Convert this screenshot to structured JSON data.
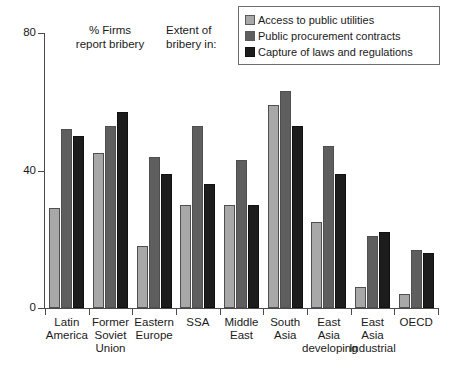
{
  "chart_data": {
    "type": "bar",
    "title": "",
    "xlabel": "",
    "ylabel": "% Firms report bribery",
    "ylim": [
      0,
      80
    ],
    "yticks": [
      0,
      40,
      80
    ],
    "grid": false,
    "legend_position": "top-right",
    "categories": [
      "Latin\nAmerica",
      "Former\nSoviet\nUnion",
      "Eastern\nEurope",
      "SSA",
      "Middle\nEast",
      "South\nAsia",
      "East\nAsia\ndeveloping",
      "East\nAsia\nIndustrial",
      "OECD"
    ],
    "series": [
      {
        "name": "Access to public utilities",
        "color": "#a8a8a8",
        "values": [
          29,
          45,
          18,
          30,
          30,
          59,
          25,
          6,
          4
        ]
      },
      {
        "name": "Public procurement contracts",
        "color": "#5e5e5e",
        "values": [
          52,
          53,
          44,
          53,
          43,
          63,
          47,
          21,
          17
        ]
      },
      {
        "name": "Capture of laws and regulations",
        "color": "#1c1c1c",
        "values": [
          50,
          57,
          39,
          36,
          30,
          53,
          39,
          22,
          16
        ]
      }
    ],
    "annotations": [
      {
        "id": "y-axis-note",
        "text": "% Firms\nreport bribery"
      },
      {
        "id": "legend-note",
        "text": "Extent of\nbribery in:"
      }
    ]
  },
  "axis": {
    "y_tick_labels": [
      "80",
      "40",
      "0"
    ]
  }
}
